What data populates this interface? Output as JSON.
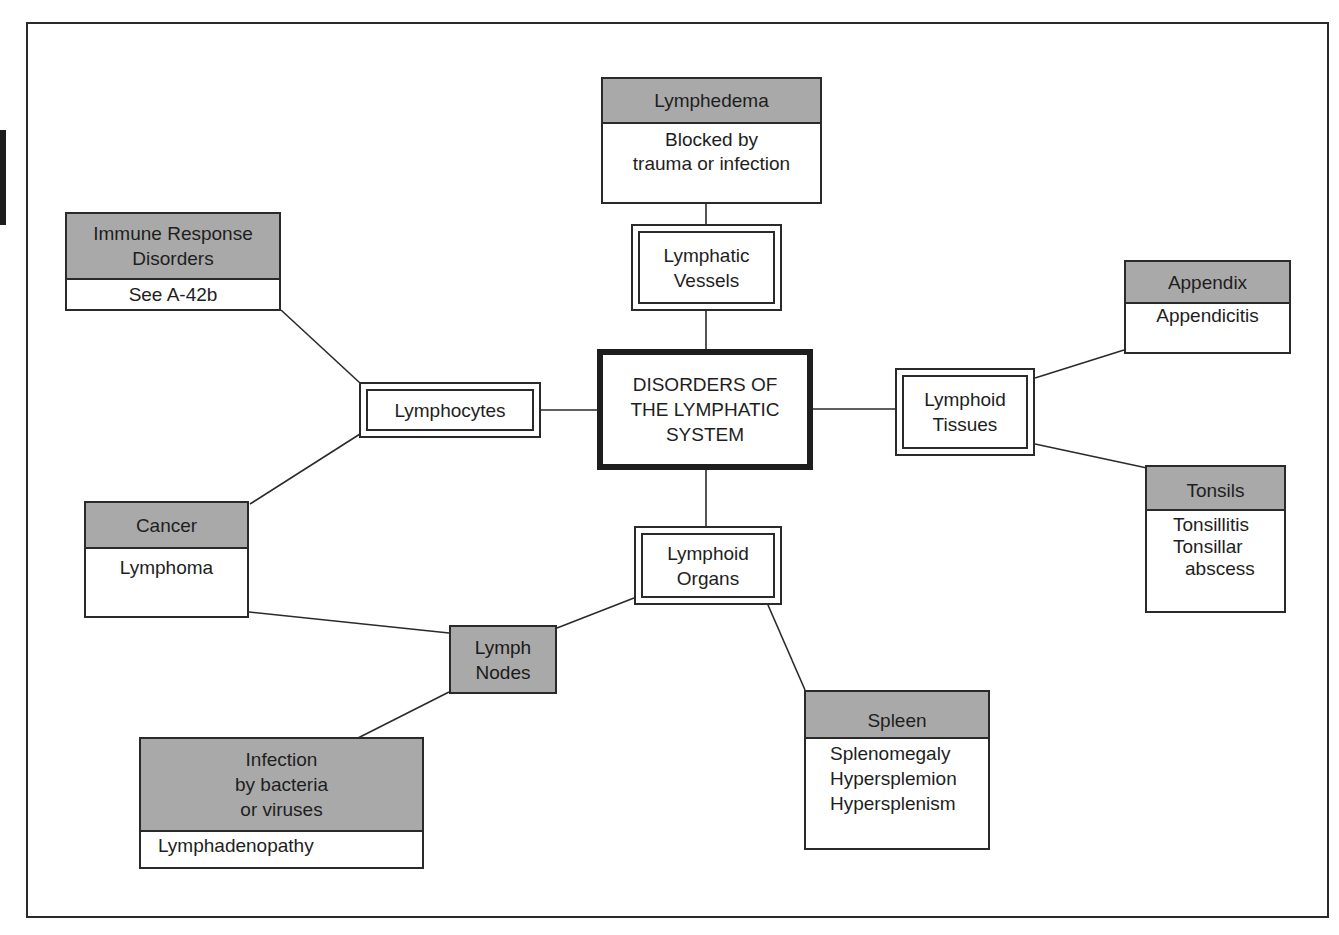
{
  "diagram": {
    "center": {
      "lines": [
        "DISORDERS OF",
        "THE LYMPHATIC",
        "SYSTEM"
      ]
    },
    "structures": {
      "lymphatic_vessels": {
        "lines": [
          "Lymphatic",
          "Vessels"
        ]
      },
      "lymphocytes": {
        "lines": [
          "Lymphocytes"
        ]
      },
      "lymphoid_tissues": {
        "lines": [
          "Lymphoid",
          "Tissues"
        ]
      },
      "lymphoid_organs": {
        "lines": [
          "Lymphoid",
          "Organs"
        ]
      },
      "lymph_nodes": {
        "lines": [
          "Lymph",
          "Nodes"
        ]
      }
    },
    "categories": {
      "lymphedema": {
        "header": [
          "Lymphedema"
        ],
        "body": [
          "Blocked by",
          "trauma or infection"
        ]
      },
      "immune_response": {
        "header": [
          "Immune Response",
          "Disorders"
        ],
        "body": [
          "See A-42b"
        ]
      },
      "cancer": {
        "header": [
          "Cancer"
        ],
        "body": [
          "Lymphoma"
        ]
      },
      "appendix": {
        "header": [
          "Appendix"
        ],
        "body": [
          "Appendicitis"
        ]
      },
      "tonsils": {
        "header": [
          "Tonsils"
        ],
        "body": [
          "Tonsillitis",
          "Tonsillar",
          "abscess"
        ]
      },
      "spleen": {
        "header": [
          "Spleen"
        ],
        "body": [
          "Splenomegaly",
          "Hypersplemion",
          "Hypersplenism"
        ]
      },
      "infection": {
        "header": [
          "Infection",
          "by bacteria",
          "or viruses"
        ],
        "body": [
          "Lymphadenopathy"
        ]
      }
    },
    "connections": [
      [
        "center",
        "lymphatic_vessels"
      ],
      [
        "lymphatic_vessels",
        "lymphedema"
      ],
      [
        "center",
        "lymphocytes"
      ],
      [
        "lymphocytes",
        "immune_response"
      ],
      [
        "lymphocytes",
        "cancer"
      ],
      [
        "center",
        "lymphoid_tissues"
      ],
      [
        "lymphoid_tissues",
        "appendix"
      ],
      [
        "lymphoid_tissues",
        "tonsils"
      ],
      [
        "center",
        "lymphoid_organs"
      ],
      [
        "lymphoid_organs",
        "lymph_nodes"
      ],
      [
        "lymphoid_organs",
        "spleen"
      ],
      [
        "lymph_nodes",
        "cancer"
      ],
      [
        "lymph_nodes",
        "infection"
      ]
    ],
    "colors": {
      "header_fill": "#a9a9a9",
      "line": "#2a2a2a",
      "background": "#ffffff"
    }
  }
}
